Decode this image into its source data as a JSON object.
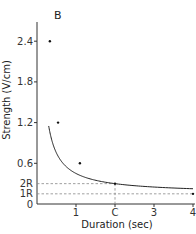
{
  "chart_data": {
    "type": "line",
    "title": "",
    "panel_label": "B",
    "xlabel": "Duration (sec)",
    "ylabel": "Strength (V/cm)",
    "xlim": [
      0,
      4
    ],
    "ylim": [
      0,
      2.6
    ],
    "x_ticks": [
      {
        "value": 1,
        "label": "1"
      },
      {
        "value": 2,
        "label": "C"
      },
      {
        "value": 3,
        "label": "3"
      },
      {
        "value": 4,
        "label": "4"
      }
    ],
    "y_ticks": [
      {
        "value": 0,
        "label": "0"
      },
      {
        "value": 0.15,
        "label": "1R"
      },
      {
        "value": 0.3,
        "label": "2R"
      },
      {
        "value": 0.6,
        "label": "0.6"
      },
      {
        "value": 1.2,
        "label": "1.2"
      },
      {
        "value": 1.8,
        "label": "1.8"
      },
      {
        "value": 2.4,
        "label": "2.4"
      }
    ],
    "grid": false,
    "series": [
      {
        "name": "strength-duration curve",
        "points": [
          {
            "x": 0.33,
            "y": 2.4
          },
          {
            "x": 0.54,
            "y": 1.2
          },
          {
            "x": 1.1,
            "y": 0.6
          },
          {
            "x": 2.0,
            "y": 0.3
          },
          {
            "x": 4.0,
            "y": 0.15
          }
        ]
      }
    ],
    "annotations": [
      {
        "type": "hline-dashed",
        "y": 0.3,
        "label": "2R"
      },
      {
        "type": "hline-dashed",
        "y": 0.15,
        "label": "1R"
      },
      {
        "type": "vline-dashed",
        "x": 2.0,
        "label": "C"
      }
    ],
    "rheobase_R": 0.15,
    "chronaxie_C": 2.0
  }
}
